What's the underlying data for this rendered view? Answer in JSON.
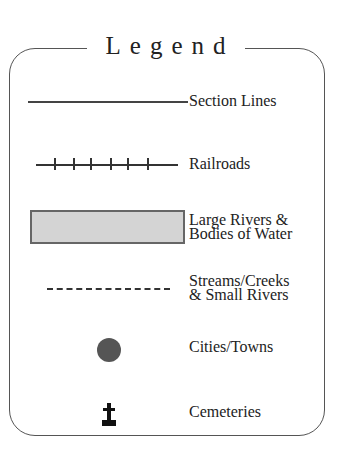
{
  "legend": {
    "title": "Legend",
    "items": [
      {
        "symbol": "solid-line",
        "label": "Section Lines"
      },
      {
        "symbol": "railroad-line",
        "label": "Railroads"
      },
      {
        "symbol": "shaded-rectangle",
        "label_line1": "Large Rivers &",
        "label_line2": "Bodies of Water",
        "fill": "#d4d4d4"
      },
      {
        "symbol": "dashed-line",
        "label_line1": "Streams/Creeks",
        "label_line2": "& Small Rivers"
      },
      {
        "symbol": "filled-circle",
        "label": "Cities/Towns",
        "fill": "#555555"
      },
      {
        "symbol": "cross-marker",
        "label": "Cemeteries"
      }
    ]
  }
}
